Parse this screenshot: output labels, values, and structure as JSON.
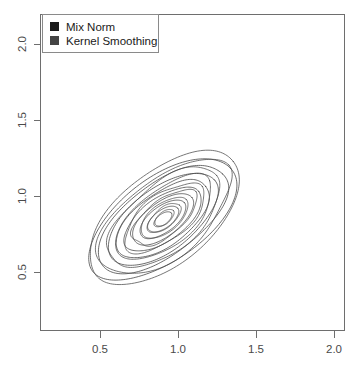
{
  "chart_data": {
    "type": "line",
    "title": "",
    "xlabel": "",
    "ylabel": "",
    "xlim": [
      0.18,
      2.1
    ],
    "ylim": [
      0.17,
      2.07
    ],
    "grid": false,
    "legend_position": "top-left",
    "legend": [
      {
        "label": "Mix Norm",
        "color": "#1a1a1a",
        "marker": "square"
      },
      {
        "label": "Kernel Smoothing",
        "color": "#444444",
        "marker": "square"
      }
    ],
    "xticks": [
      0.5,
      1.0,
      1.5,
      2.0
    ],
    "xticklabels": [
      "0.5",
      "1.0",
      "1.5",
      "2.0"
    ],
    "yticks": [
      0.5,
      1.0,
      1.5,
      2.0
    ],
    "yticklabels": [
      "0.5",
      "1.0",
      "1.5",
      "2.0"
    ],
    "series": [
      {
        "name": "Mix Norm",
        "type": "contour",
        "center": [
          0.9,
          0.85
        ],
        "orientation_deg": 38,
        "levels": [
          0.05,
          0.12,
          0.22,
          0.35,
          0.5,
          0.68,
          0.88,
          1.1,
          1.32
        ],
        "contours": [
          {
            "level": 0.05,
            "semi_major": 0.56,
            "semi_minor": 0.27
          },
          {
            "level": 0.12,
            "semi_major": 0.49,
            "semi_minor": 0.235
          },
          {
            "level": 0.22,
            "semi_major": 0.42,
            "semi_minor": 0.202
          },
          {
            "level": 0.35,
            "semi_major": 0.355,
            "semi_minor": 0.17
          },
          {
            "level": 0.5,
            "semi_major": 0.292,
            "semi_minor": 0.14
          },
          {
            "level": 0.68,
            "semi_major": 0.232,
            "semi_minor": 0.111
          },
          {
            "level": 0.88,
            "semi_major": 0.175,
            "semi_minor": 0.084
          },
          {
            "level": 1.1,
            "semi_major": 0.12,
            "semi_minor": 0.058
          },
          {
            "level": 1.32,
            "semi_major": 0.068,
            "semi_minor": 0.034
          }
        ]
      },
      {
        "name": "Kernel Smoothing",
        "type": "contour",
        "center": [
          0.91,
          0.86
        ],
        "orientation_deg": 40,
        "levels": [
          0.05,
          0.12,
          0.22,
          0.35,
          0.5,
          0.68,
          0.88,
          1.1,
          1.32
        ],
        "contours": [
          {
            "level": 0.05,
            "semi_major": 0.6,
            "semi_minor": 0.29
          },
          {
            "level": 0.12,
            "semi_major": 0.52,
            "semi_minor": 0.249
          },
          {
            "level": 0.22,
            "semi_major": 0.445,
            "semi_minor": 0.214
          },
          {
            "level": 0.35,
            "semi_major": 0.375,
            "semi_minor": 0.181
          },
          {
            "level": 0.5,
            "semi_major": 0.308,
            "semi_minor": 0.149
          },
          {
            "level": 0.68,
            "semi_major": 0.245,
            "semi_minor": 0.119
          },
          {
            "level": 0.88,
            "semi_major": 0.185,
            "semi_minor": 0.09
          },
          {
            "level": 1.1,
            "semi_major": 0.128,
            "semi_minor": 0.063
          },
          {
            "level": 1.32,
            "semi_major": 0.074,
            "semi_minor": 0.038
          }
        ]
      }
    ]
  },
  "axes": {
    "x_tick_labels": [
      "0.5",
      "1.0",
      "1.5",
      "2.0"
    ],
    "y_tick_labels": [
      "0.5",
      "1.0",
      "1.5",
      "2.0"
    ]
  },
  "legend": {
    "entries": [
      {
        "label": "Mix Norm",
        "swatch_color": "#1a1a1a"
      },
      {
        "label": "Kernel Smoothing",
        "swatch_color": "#444444"
      }
    ]
  }
}
